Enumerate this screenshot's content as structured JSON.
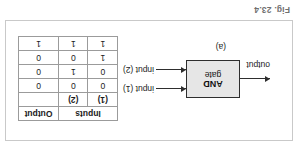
{
  "figure": {
    "caption": "Fig. 23.4",
    "sublabel": "(a)"
  },
  "diagram": {
    "gate": {
      "line1": "AND",
      "line2": "gate"
    },
    "input1_label": "input (1)",
    "input2_label": "input (2)",
    "output_label": "output"
  },
  "truth_table": {
    "header_inputs": "Inputs",
    "header_output": "Output",
    "col_input1": "(1)",
    "col_input2": "(2)",
    "rows": [
      {
        "input1": "0",
        "input2": "0",
        "output": "0"
      },
      {
        "input1": "0",
        "input2": "1",
        "output": "0"
      },
      {
        "input1": "1",
        "input2": "0",
        "output": "0"
      },
      {
        "input1": "1",
        "input2": "1",
        "output": "1"
      }
    ]
  },
  "colors": {
    "gate_fill": "#e6e6e6",
    "line": "#2e2e2e",
    "frame": "#c9c9c9",
    "caption": "#6f6f6f"
  }
}
